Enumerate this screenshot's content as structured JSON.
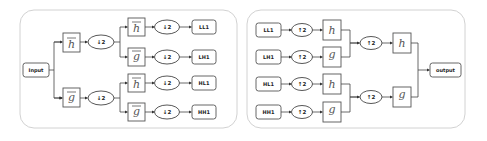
{
  "diagram": {
    "type": "wavelet-filter-bank",
    "decomposition": {
      "input_label": "Input",
      "level1": [
        {
          "filter": "h",
          "bar": true,
          "op": "↓2"
        },
        {
          "filter": "g",
          "bar": true,
          "op": "↓2"
        }
      ],
      "level2": [
        {
          "filter": "h",
          "bar": true,
          "op": "↓2",
          "output": "LL1"
        },
        {
          "filter": "g",
          "bar": true,
          "op": "↓2",
          "output": "LH1"
        },
        {
          "filter": "h",
          "bar": true,
          "op": "↓2",
          "output": "HL1"
        },
        {
          "filter": "g",
          "bar": true,
          "op": "↓2",
          "output": "HH1"
        }
      ]
    },
    "reconstruction": {
      "inputs": [
        {
          "label": "LL1",
          "op": "↑2",
          "filter": "h"
        },
        {
          "label": "LH1",
          "op": "↑2",
          "filter": "g"
        },
        {
          "label": "HL1",
          "op": "↑2",
          "filter": "h"
        },
        {
          "label": "HH1",
          "op": "↑2",
          "filter": "g"
        }
      ],
      "merge": [
        {
          "op": "↑2",
          "filter": "h"
        },
        {
          "op": "↑2",
          "filter": "g"
        }
      ],
      "output_label": "output"
    }
  },
  "colors": {
    "panel_border": "#d2d2d2",
    "stroke": "#444444",
    "text": "#222222",
    "background": "#ffffff"
  }
}
